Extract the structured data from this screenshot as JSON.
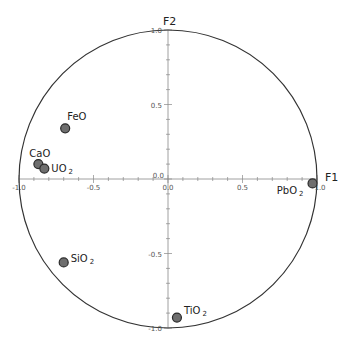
{
  "chart_data": {
    "type": "scatter",
    "subtype": "correlation-circle",
    "title": "",
    "xlabel": "F1",
    "ylabel": "F2",
    "xlim": [
      -1.0,
      1.0
    ],
    "ylim": [
      -1.0,
      1.0
    ],
    "grid": false,
    "x_ticks": [
      -1.0,
      -0.5,
      0.0,
      0.5,
      1.0
    ],
    "x_tick_labels": [
      "-1.0",
      "-0.5",
      "0.0",
      "0.5",
      "1.0"
    ],
    "y_ticks": [
      -1.0,
      -0.5,
      0.0,
      0.5,
      1.0
    ],
    "y_tick_labels": [
      "-1.0",
      "-0.5",
      "0.0",
      "0.5",
      "1.0"
    ],
    "unit_circle": true,
    "points": [
      {
        "label": "FeO",
        "base": "FeO",
        "sub": "",
        "x": -0.69,
        "y": 0.34
      },
      {
        "label": "CaO",
        "base": "CaO",
        "sub": "",
        "x": -0.87,
        "y": 0.1
      },
      {
        "label": "UO2",
        "base": "UO",
        "sub": "2",
        "x": -0.83,
        "y": 0.07
      },
      {
        "label": "SiO2",
        "base": "SiO",
        "sub": "2",
        "x": -0.7,
        "y": -0.56
      },
      {
        "label": "TiO2",
        "base": "TiO",
        "sub": "2",
        "x": 0.06,
        "y": -0.93
      },
      {
        "label": "PbO2",
        "base": "PbO",
        "sub": "2",
        "x": 0.97,
        "y": -0.03
      }
    ]
  },
  "colors": {
    "circle": "#333333",
    "axis": "#888888",
    "point_fill": "#6e6e6e",
    "point_stroke": "#2a2a2a"
  }
}
